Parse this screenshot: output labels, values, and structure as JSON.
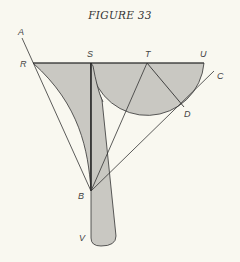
{
  "figure": {
    "title": "FIGURE 33",
    "labels": {
      "A": "A",
      "R": "R",
      "S": "S",
      "T": "T",
      "U": "U",
      "C": "C",
      "D": "D",
      "B": "B",
      "V": "V"
    },
    "colors": {
      "background": "#f9f8f0",
      "fill": "#c9c8c2",
      "stroke": "#333333"
    }
  }
}
